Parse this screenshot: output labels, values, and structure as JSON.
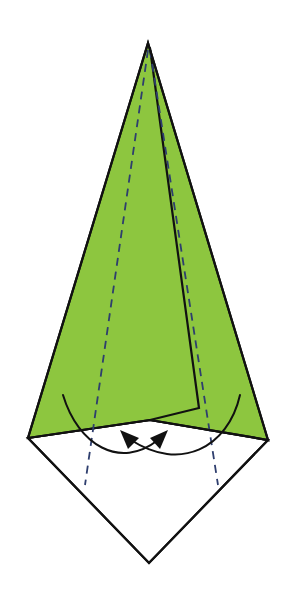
{
  "diagram": {
    "colors": {
      "paper_colored_side": "#8DC63F",
      "paper_white_side": "#FFFFFF",
      "outline": "#111111",
      "valley_fold_line": "#2E3E6E"
    },
    "elements": [
      {
        "name": "white-paper-lower-diamond",
        "kind": "white paper region"
      },
      {
        "name": "green-kite-flap",
        "kind": "colored paper region"
      },
      {
        "name": "inner-folded-flap",
        "kind": "folded flap edge"
      },
      {
        "name": "valley-fold-line-left",
        "kind": "dashed valley fold"
      },
      {
        "name": "valley-fold-line-right",
        "kind": "dashed valley fold"
      },
      {
        "name": "fold-arrow-left-to-right",
        "kind": "curved fold arrow"
      },
      {
        "name": "fold-arrow-right-to-left",
        "kind": "curved fold arrow"
      }
    ],
    "symbols": {
      "valley_fold": "dashed line",
      "fold_and_unfold": "pair of crossing curved arrows"
    }
  }
}
